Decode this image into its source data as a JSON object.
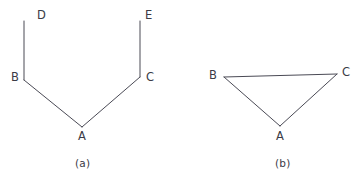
{
  "page": {
    "background_color": "#ffffff",
    "width": 358,
    "height": 180
  },
  "style": {
    "stroke_color": "#4a4a55",
    "stroke_width": 1,
    "label_color": "#3b3b46"
  },
  "figures": [
    {
      "id": "figure-a",
      "caption": "(a)",
      "caption_position": {
        "x": 82,
        "y": 163
      },
      "description": "open chain D-B-A-C-E",
      "points": {
        "A": {
          "x": 82,
          "y": 127
        },
        "B": {
          "x": 24,
          "y": 80
        },
        "C": {
          "x": 140,
          "y": 77
        },
        "D": {
          "x": 24,
          "y": 21
        },
        "E": {
          "x": 140,
          "y": 21
        }
      },
      "segments": [
        {
          "name": "segment-db",
          "from": "D",
          "to": "B"
        },
        {
          "name": "segment-ba",
          "from": "B",
          "to": "A"
        },
        {
          "name": "segment-ac",
          "from": "A",
          "to": "C"
        },
        {
          "name": "segment-ce",
          "from": "C",
          "to": "E"
        }
      ],
      "labels": [
        {
          "name": "label-d",
          "text": "D",
          "x": 37,
          "y": 10
        },
        {
          "name": "label-e",
          "text": "E",
          "x": 145,
          "y": 10
        },
        {
          "name": "label-b",
          "text": "B",
          "x": 11,
          "y": 72
        },
        {
          "name": "label-c",
          "text": "C",
          "x": 146,
          "y": 72
        },
        {
          "name": "label-a",
          "text": "A",
          "x": 78,
          "y": 131
        }
      ]
    },
    {
      "id": "figure-b",
      "caption": "(b)",
      "caption_position": {
        "x": 283,
        "y": 163
      },
      "description": "closed triangle A-B-C",
      "points": {
        "A": {
          "x": 280,
          "y": 126
        },
        "B": {
          "x": 224,
          "y": 77
        },
        "C": {
          "x": 337,
          "y": 74
        }
      },
      "segments": [
        {
          "name": "segment-bc",
          "from": "B",
          "to": "C"
        },
        {
          "name": "segment-ba",
          "from": "B",
          "to": "A"
        },
        {
          "name": "segment-ac",
          "from": "A",
          "to": "C"
        }
      ],
      "labels": [
        {
          "name": "label-b",
          "text": "B",
          "x": 209,
          "y": 70
        },
        {
          "name": "label-c",
          "text": "C",
          "x": 342,
          "y": 67
        },
        {
          "name": "label-a",
          "text": "A",
          "x": 276,
          "y": 131
        }
      ]
    }
  ]
}
